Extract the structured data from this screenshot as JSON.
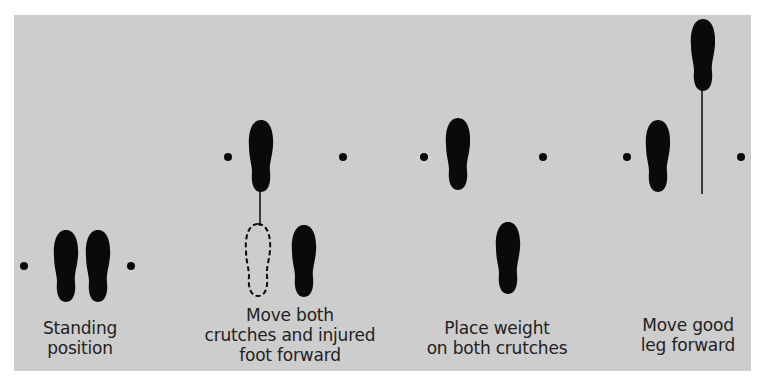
{
  "diagram": {
    "background_color": "#cdcdcd",
    "ink_color": "#0a0a0a",
    "steps": [
      {
        "id": "standing",
        "caption_lines": [
          "Standing",
          "position"
        ]
      },
      {
        "id": "move-crutches-injured",
        "caption_lines": [
          "Move both",
          "crutches and injured",
          "foot forward"
        ]
      },
      {
        "id": "place-weight",
        "caption_lines": [
          "Place weight",
          "on both crutches"
        ]
      },
      {
        "id": "move-good-leg",
        "caption_lines": [
          "Move good",
          "leg forward"
        ]
      }
    ]
  }
}
